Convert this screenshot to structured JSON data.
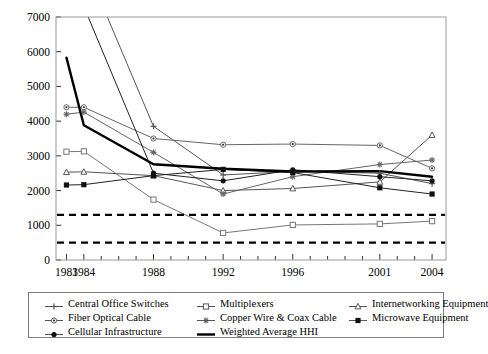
{
  "chart_data": {
    "type": "line",
    "title": "",
    "xlabel": "",
    "ylabel": "",
    "x": [
      1983,
      1984,
      1988,
      1992,
      1996,
      2001,
      2004
    ],
    "tick_labels": [
      "1983",
      "1984",
      "1988",
      "1992",
      "1996",
      "2001",
      "2004"
    ],
    "xlim": [
      1982.4,
      2004.8
    ],
    "ylim": [
      0,
      7000
    ],
    "ytick_values": [
      0,
      1000,
      2000,
      3000,
      4000,
      5000,
      6000,
      7000
    ],
    "ytick_labels": [
      "0",
      "1000",
      "2000",
      "3000",
      "4000",
      "5000",
      "6000",
      "7000"
    ],
    "grid": false,
    "legend_position": "below",
    "series": [
      {
        "name": "Central Office Switches",
        "marker": "plus",
        "color": "#555555",
        "values": [
          9500,
          8600,
          3850,
          2450,
          2550,
          2500,
          2200
        ]
      },
      {
        "name": "Multiplexers",
        "marker": "open-square",
        "color": "#777777",
        "values": [
          3120,
          3130,
          1740,
          780,
          1010,
          1040,
          1120
        ]
      },
      {
        "name": "Internetworking Equipment",
        "marker": "triangle",
        "color": "#555555",
        "values": [
          2530,
          2540,
          2430,
          2000,
          2060,
          2250,
          3600
        ]
      },
      {
        "name": "Fiber Optical Cable",
        "marker": "dot-circle",
        "color": "#666666",
        "values": [
          4400,
          4400,
          3500,
          3320,
          3340,
          3300,
          2640
        ]
      },
      {
        "name": "Copper Wire & Coax Cable",
        "marker": "star",
        "color": "#666666",
        "values": [
          4200,
          4260,
          3100,
          1900,
          2400,
          2750,
          2880
        ]
      },
      {
        "name": "Microwave Equipment",
        "marker": "filled-square",
        "color": "#222222",
        "values": [
          2160,
          2170,
          2430,
          2610,
          2520,
          2080,
          1900
        ]
      },
      {
        "name": "Cellular Infrastructure",
        "marker": "filled-circle",
        "color": "#222222",
        "values": [
          11000,
          7300,
          2500,
          2280,
          2600,
          2400,
          2280
        ]
      },
      {
        "name": "Weighted Average HHI",
        "marker": "none",
        "color": "#000000",
        "values": [
          5830,
          3880,
          2760,
          2630,
          2550,
          2560,
          2400
        ]
      }
    ],
    "reference_lines": [
      {
        "name": "upper-threshold",
        "value": 1300,
        "style": "dashed"
      },
      {
        "name": "lower-threshold",
        "value": 500,
        "style": "dashed"
      }
    ]
  },
  "legend": {
    "entries": [
      {
        "label": "Central Office Switches",
        "marker": "plus"
      },
      {
        "label": "Multiplexers",
        "marker": "open-square"
      },
      {
        "label": "Internetworking Equipment",
        "marker": "triangle"
      },
      {
        "label": "Fiber Optical Cable",
        "marker": "dot-circle"
      },
      {
        "label": "Copper Wire & Coax Cable",
        "marker": "star"
      },
      {
        "label": "Microwave Equipment",
        "marker": "filled-square"
      },
      {
        "label": "Cellular Infrastructure",
        "marker": "filled-circle"
      },
      {
        "label": "Weighted Average HHI",
        "marker": "none"
      }
    ]
  }
}
